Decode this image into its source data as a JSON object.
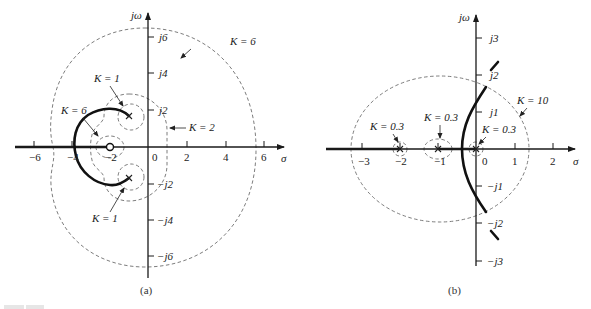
{
  "diagram": {
    "type": "root-locus-with-gain-contours",
    "panels": [
      {
        "id": "a",
        "caption": "(a)",
        "axis_labels": {
          "real": "σ",
          "imag": "jω"
        },
        "real_ticks": [
          "−6",
          "−4",
          "−2",
          "0",
          "2",
          "4",
          "6"
        ],
        "imag_ticks": [
          "j6",
          "j4",
          "j2",
          "−j2",
          "−j4",
          "−j6"
        ],
        "annotations": [
          {
            "id": "k6-outer",
            "text": "K = 6"
          },
          {
            "id": "k1-upper",
            "text": "K = 1"
          },
          {
            "id": "k6-inner",
            "text": "K = 6"
          },
          {
            "id": "k2",
            "text": "K = 2"
          },
          {
            "id": "k1-lower",
            "text": "K = 1"
          }
        ],
        "poles": [
          "−1 + j1.7",
          "−1 − j1.7"
        ],
        "zeros": [
          "−2"
        ]
      },
      {
        "id": "b",
        "caption": "(b)",
        "axis_labels": {
          "real": "σ",
          "imag": "jω"
        },
        "real_ticks": [
          "−3",
          "−2",
          "−1",
          "0",
          "1",
          "2"
        ],
        "imag_ticks": [
          "j3",
          "j2",
          "j1",
          "−j1",
          "−j2",
          "−j3"
        ],
        "annotations": [
          {
            "id": "k03-left",
            "text": "K = 0.3"
          },
          {
            "id": "k03-mid",
            "text": "K = 0.3"
          },
          {
            "id": "k03-origin",
            "text": "K = 0.3"
          },
          {
            "id": "k10",
            "text": "K = 10"
          }
        ],
        "poles": [
          "−2",
          "−1",
          "0"
        ],
        "zeros": []
      }
    ],
    "figure_label": "Figure"
  },
  "colors": {
    "ink": "#1a1a1a",
    "dashed": "#6e6e6e",
    "background": "#ffffff"
  }
}
